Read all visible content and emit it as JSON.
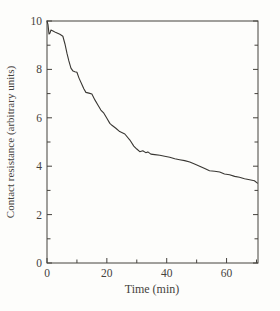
{
  "figure": {
    "background_color": "#fdfdfb",
    "ink_color": "#45423d",
    "curve_color": "#393733"
  },
  "chart_data": {
    "type": "line",
    "title": "",
    "xlabel": "Time (min)",
    "ylabel": "Contact resistance (arbitrary units)",
    "xlim": [
      0,
      70.5
    ],
    "ylim": [
      0,
      10
    ],
    "x_major_ticks": [
      0,
      20,
      40,
      60
    ],
    "x_minor_ticks": [
      10,
      30,
      50,
      70
    ],
    "y_major_ticks": [
      0,
      2,
      4,
      6,
      8,
      10
    ],
    "y_minor_ticks": [
      1,
      3,
      5,
      7,
      9
    ],
    "x_tick_labels": [
      "0",
      "20",
      "40",
      "60"
    ],
    "y_tick_labels": [
      "0",
      "2",
      "4",
      "6",
      "8",
      "10"
    ],
    "grid": false,
    "frame": "box",
    "legend": "none",
    "series": [
      {
        "name": "contact-resistance",
        "x": [
          0,
          0.33,
          0.67,
          1.0,
          1.33,
          2.0,
          3.0,
          4.3,
          5.3,
          6.0,
          6.7,
          7.3,
          8.0,
          8.7,
          9.3,
          10.0,
          10.7,
          11.7,
          12.3,
          13.0,
          14.0,
          15.0,
          16.0,
          17.0,
          18.0,
          19.0,
          20.0,
          21.0,
          21.7,
          23.0,
          24.3,
          26.0,
          27.7,
          29.0,
          30.0,
          31.0,
          32.0,
          33.0,
          33.7,
          34.7,
          36.0,
          37.7,
          39.3,
          41.0,
          42.7,
          44.3,
          46.0,
          47.7,
          49.3,
          51.0,
          52.7,
          54.3,
          56.0,
          57.7,
          59.3,
          61.0,
          62.7,
          64.3,
          66.0,
          67.7,
          69.3,
          70.3
        ],
        "y": [
          10.0,
          9.85,
          9.46,
          9.5,
          9.63,
          9.59,
          9.52,
          9.45,
          9.37,
          9.05,
          8.65,
          8.35,
          8.05,
          7.93,
          7.9,
          7.88,
          7.64,
          7.37,
          7.2,
          7.05,
          7.02,
          6.98,
          6.74,
          6.53,
          6.32,
          6.19,
          5.98,
          5.77,
          5.69,
          5.57,
          5.43,
          5.33,
          5.08,
          4.83,
          4.71,
          4.6,
          4.64,
          4.56,
          4.59,
          4.5,
          4.48,
          4.45,
          4.41,
          4.37,
          4.31,
          4.27,
          4.23,
          4.17,
          4.09,
          4.0,
          3.9,
          3.81,
          3.79,
          3.76,
          3.68,
          3.65,
          3.58,
          3.54,
          3.48,
          3.44,
          3.4,
          3.3
        ]
      }
    ]
  }
}
